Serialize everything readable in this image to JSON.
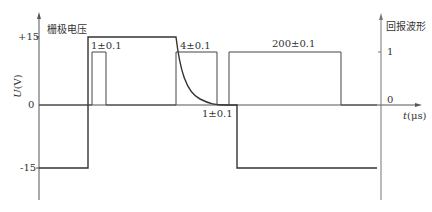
{
  "left_axis": {
    "title": "栅极电压",
    "unit_label_var": "U",
    "unit_label_unit": "(V)",
    "ticks": [
      "+15",
      "0",
      "-15"
    ]
  },
  "right_axis": {
    "title": "回报波形",
    "ticks": [
      "1",
      "0"
    ]
  },
  "time_axis": {
    "label_var": "t",
    "label_unit": "(μs)"
  },
  "annotations": {
    "pulse1_width": "1±0.1",
    "decay_time": "4±0.1",
    "gap": "1±0.1",
    "pulse2_width": "200±0.1"
  },
  "colors": {
    "line": "#333333",
    "axis": "#555555"
  }
}
